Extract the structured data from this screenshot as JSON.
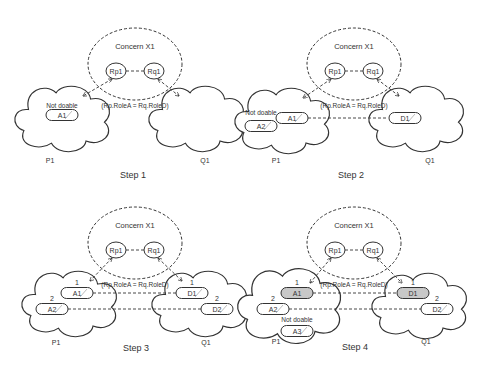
{
  "diagram": {
    "colors": {
      "line": "#333333",
      "fill": "#ffffff",
      "done_fill": "#c8c8c8",
      "hatch": "#aaaaaa"
    },
    "panels": [
      {
        "step": "Step 1",
        "ox": 0,
        "oy": 0,
        "concern": "Concern X1",
        "roles": [
          "Rp1",
          "Rq1"
        ],
        "constraint": "(Rp.RoleA = Rq.RoleD)",
        "left_actor": "P1",
        "right_actor": "Q1",
        "left_activities": [
          {
            "label": "A1",
            "x": 62,
            "y": 115,
            "rank": "",
            "done": false
          }
        ],
        "right_activities": [],
        "not_doable": {
          "text": "Not doable",
          "x": 62,
          "y": 108
        },
        "links": [],
        "p_label_pos": [
          50,
          163
        ],
        "q_label_pos": [
          205,
          163
        ],
        "step_pos": [
          133,
          178
        ],
        "left_cloud": [
          63,
          118
        ],
        "right_cloud": [
          197,
          118
        ],
        "a3": false
      },
      {
        "step": "Step 2",
        "ox": 0,
        "oy": 0,
        "concern": "Concern X1",
        "roles": [
          "Rp1",
          "Rq1"
        ],
        "constraint": "(Rp.RoleA = Rq.RoleD)",
        "left_actor": "P1",
        "right_actor": "Q1",
        "left_activities": [
          {
            "label": "A1",
            "x": 292,
            "y": 118,
            "rank": "",
            "done": false
          },
          {
            "label": "A2",
            "x": 261,
            "y": 126,
            "rank": "",
            "done": false
          }
        ],
        "right_activities": [
          {
            "label": "D1",
            "x": 405,
            "y": 118,
            "rank": "",
            "done": false
          }
        ],
        "not_doable": {
          "text": "Not doable",
          "x": 261,
          "y": 115
        },
        "links": [
          [
            308,
            118,
            387,
            118
          ]
        ],
        "p_label_pos": [
          276,
          163
        ],
        "q_label_pos": [
          430,
          163
        ],
        "step_pos": [
          351,
          178
        ],
        "left_cloud": [
          283,
          120
        ],
        "right_cloud": [
          417,
          118
        ],
        "a3": false
      },
      {
        "step": "Step 3",
        "ox": 0,
        "oy": 0,
        "concern": "Concern X1",
        "roles": [
          "Rp1",
          "Rq1"
        ],
        "constraint": "(Rp.RoleA = Rq.RoleD)",
        "left_actor": "P1",
        "right_actor": "Q1",
        "left_activities": [
          {
            "label": "A1",
            "x": 77,
            "y": 293,
            "rank": "1",
            "done": false
          },
          {
            "label": "A2",
            "x": 52,
            "y": 309,
            "rank": "2",
            "done": false
          }
        ],
        "right_activities": [
          {
            "label": "D1",
            "x": 192,
            "y": 293,
            "rank": "1",
            "done": false
          },
          {
            "label": "D2",
            "x": 217,
            "y": 309,
            "rank": "2",
            "done": false
          }
        ],
        "not_doable": null,
        "links": [
          [
            93,
            293,
            176,
            293
          ],
          [
            68,
            309,
            201,
            309
          ]
        ],
        "p_label_pos": [
          56,
          345
        ],
        "q_label_pos": [
          206,
          345
        ],
        "step_pos": [
          136,
          351
        ],
        "left_cloud": [
          70,
          303
        ],
        "right_cloud": [
          200,
          303
        ],
        "a3": false
      },
      {
        "step": "Step 4",
        "ox": 0,
        "oy": 0,
        "concern": "Concern X1",
        "roles": [
          "Rp1",
          "Rq1"
        ],
        "constraint": "(Rp.RoleA = Rq.RoleD)",
        "left_actor": "P1",
        "right_actor": "Q1",
        "left_activities": [
          {
            "label": "A1",
            "x": 297,
            "y": 293,
            "rank": "1",
            "done": true
          },
          {
            "label": "A2",
            "x": 273,
            "y": 309,
            "rank": "2",
            "done": false
          },
          {
            "label": "A3",
            "x": 297,
            "y": 331,
            "rank": "",
            "done": false
          }
        ],
        "right_activities": [
          {
            "label": "D1",
            "x": 413,
            "y": 293,
            "rank": "1",
            "done": true
          },
          {
            "label": "D2",
            "x": 437,
            "y": 309,
            "rank": "2",
            "done": false
          }
        ],
        "not_doable": {
          "text": "Not doable",
          "x": 297,
          "y": 322
        },
        "links": [
          [
            313,
            293,
            397,
            293
          ],
          [
            289,
            309,
            421,
            309
          ]
        ],
        "p_label_pos": [
          276,
          344
        ],
        "q_label_pos": [
          426,
          344
        ],
        "step_pos": [
          355,
          350
        ],
        "left_cloud": [
          290,
          305
        ],
        "right_cloud": [
          420,
          305
        ],
        "a3": true
      }
    ]
  }
}
